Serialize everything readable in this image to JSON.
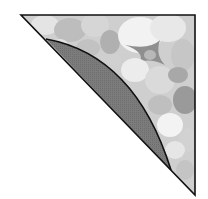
{
  "diagram": {
    "type": "geometry",
    "triangle": {
      "vertices": [
        [
          21,
          15
        ],
        [
          195,
          15
        ],
        [
          195,
          195
        ]
      ],
      "stroke": "#111111",
      "texture_colors": [
        "#e9e9e9",
        "#d8d8d8",
        "#c8c8c8",
        "#b5b5b5",
        "#a3a3a3",
        "#f4f4f4",
        "#8f8f8f"
      ]
    },
    "segment": {
      "arc_start": [
        46,
        39
      ],
      "arc_end": [
        171,
        170
      ],
      "fill": "#7a7a7a",
      "stroke": "#111111"
    },
    "background": "#ffffff"
  }
}
